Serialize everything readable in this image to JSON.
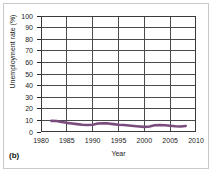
{
  "panel": {
    "label": "(b)"
  },
  "chart_data": {
    "type": "line",
    "title": "",
    "xlabel": "Year",
    "ylabel": "Unemployment rate (%)",
    "xlim": [
      1980,
      2010
    ],
    "ylim": [
      0,
      100
    ],
    "grid": true,
    "legend": null,
    "x_ticks": [
      1980,
      1985,
      1990,
      1995,
      2000,
      2005,
      2010
    ],
    "y_ticks": [
      0,
      10,
      20,
      30,
      40,
      50,
      60,
      70,
      80,
      90,
      100
    ],
    "x_minor_gridlines": [
      1985,
      1990,
      1995,
      2000,
      2005
    ],
    "line_color": "#7a4b7d",
    "line_width": 2.6,
    "series": [
      {
        "name": "Unemployment rate",
        "x": [
          1982,
          1983,
          1984,
          1985,
          1986,
          1987,
          1988,
          1989,
          1990,
          1991,
          1992,
          1993,
          1994,
          1995,
          1996,
          1997,
          1998,
          1999,
          2000,
          2001,
          2002,
          2003,
          2004,
          2005,
          2006,
          2007,
          2008
        ],
        "values": [
          9.6,
          9.5,
          8.6,
          7.9,
          7.4,
          6.8,
          6.3,
          6.0,
          6.3,
          7.3,
          7.6,
          7.4,
          6.8,
          6.3,
          6.0,
          5.6,
          5.2,
          4.8,
          4.4,
          4.7,
          5.8,
          6.0,
          5.8,
          5.4,
          5.0,
          4.8,
          5.2
        ]
      }
    ]
  }
}
